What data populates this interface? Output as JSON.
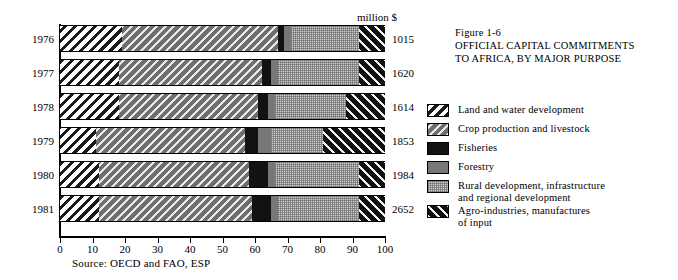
{
  "chart_data": {
    "type": "bar",
    "orientation": "horizontal",
    "stacked": true,
    "normalized_percent": true,
    "title": "OFFICIAL CAPITAL COMMITMENTS TO AFRICA, BY MAJOR PURPOSE",
    "figure_number": "Figure 1-6",
    "xlabel": "",
    "ylabel": "",
    "xlim": [
      0,
      100
    ],
    "grid": false,
    "unit_label": "million $",
    "source": "Source: OECD and FAO, ESP",
    "categories": [
      "1976",
      "1977",
      "1978",
      "1979",
      "1980",
      "1981"
    ],
    "totals": [
      1015,
      1620,
      1614,
      1853,
      1984,
      2652
    ],
    "totals_unit": "million $",
    "x_ticks": [
      0,
      10,
      20,
      30,
      40,
      50,
      60,
      70,
      80,
      90,
      100
    ],
    "series": [
      {
        "name": "Land and water development",
        "pattern": "black-diagonal-hatch-backslash-on-white",
        "values": [
          19,
          18,
          18,
          11,
          12,
          12
        ]
      },
      {
        "name": "Crop production and livestock",
        "pattern": "white-diagonal-hatch-on-dark-grey",
        "values": [
          48,
          44,
          43,
          46,
          46,
          47
        ]
      },
      {
        "name": "Fisheries",
        "pattern": "solid-black",
        "values": [
          2,
          3,
          3,
          4,
          6,
          6
        ]
      },
      {
        "name": "Forestry",
        "pattern": "solid-medium-grey",
        "values": [
          2,
          2,
          2,
          4,
          2,
          2
        ]
      },
      {
        "name": "Rural development, infrastructure and regional development",
        "pattern": "light-grey-stipple",
        "values": [
          21,
          25,
          22,
          16,
          26,
          25
        ]
      },
      {
        "name": "Agro-industries, manufactures of input",
        "pattern": "white-diagonal-hatch-on-black",
        "values": [
          8,
          8,
          12,
          19,
          8,
          8
        ]
      }
    ]
  },
  "legend": {
    "items": [
      {
        "label": "Land and water development",
        "swatch": "pat-land"
      },
      {
        "label": "Crop production and livestock",
        "swatch": "pat-crop"
      },
      {
        "label": "Fisheries",
        "swatch": "pat-fish"
      },
      {
        "label": "Forestry",
        "swatch": "pat-forest"
      },
      {
        "label": "Rural development, infrastructure\nand regional development",
        "swatch": "pat-rural"
      },
      {
        "label": "Agro-industries, manufactures\nof input",
        "swatch": "pat-agro"
      }
    ]
  },
  "figure_caption": {
    "number": "Figure 1-6",
    "line1": "OFFICIAL CAPITAL COMMITMENTS",
    "line2": "TO AFRICA,  BY MAJOR PURPOSE"
  }
}
